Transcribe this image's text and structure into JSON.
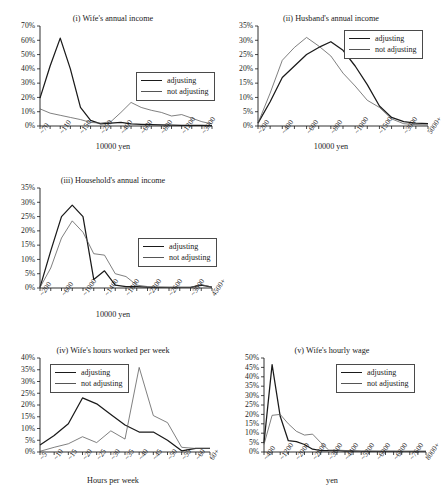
{
  "figure": {
    "legend": {
      "adjusting": "adjusting",
      "not_adjusting": "not adjusting"
    }
  },
  "chart_data": [
    {
      "id": "wife-annual-income",
      "type": "line",
      "title": "(i) Wife's annual income",
      "xlabel": "10000 yen",
      "ylabel": "",
      "ylim": [
        0,
        70
      ],
      "ytick_labels": [
        "0%",
        "10%",
        "20%",
        "30%",
        "40%",
        "50%",
        "60%",
        "70%"
      ],
      "ytick_values": [
        0,
        10,
        20,
        30,
        40,
        50,
        60,
        70
      ],
      "grid": false,
      "legend_position": "center-right",
      "categories": [
        "~70",
        "~90",
        "~110",
        "~130",
        "~150",
        "~200",
        "~250",
        "~300",
        "~400",
        "~500",
        "~600",
        "~700",
        "~800",
        "~900",
        "~1200",
        "~1500",
        "~3000",
        "5000+"
      ],
      "tick_label_every": 2,
      "visible_tick_labels": [
        "~70",
        "~130",
        "~150",
        "~300",
        "~500",
        "~700",
        "~900",
        "~1500",
        "5000+"
      ],
      "series": [
        {
          "name": "adjusting",
          "values": [
            19.5,
            42.0,
            61.5,
            40.0,
            13.0,
            4.0,
            1.5,
            2.0,
            2.5,
            1.5,
            1.2,
            1.0,
            0.8,
            0.6,
            0.5,
            0.5,
            0.4,
            0.3
          ]
        },
        {
          "name": "not adjusting",
          "values": [
            12.0,
            9.0,
            7.5,
            6.0,
            4.5,
            2.5,
            2.0,
            3.0,
            9.5,
            16.5,
            13.0,
            11.0,
            9.5,
            7.0,
            8.0,
            5.5,
            3.0,
            1.5
          ]
        }
      ]
    },
    {
      "id": "husband-annual-income",
      "type": "line",
      "title": "(ii) Husband's annual income",
      "xlabel": "10000 yen",
      "ylabel": "",
      "ylim": [
        0,
        35
      ],
      "ytick_labels": [
        "0%",
        "5%",
        "10%",
        "15%",
        "20%",
        "25%",
        "30%",
        "35%"
      ],
      "ytick_values": [
        0,
        5,
        10,
        15,
        20,
        25,
        30,
        35
      ],
      "grid": false,
      "legend_position": "top-right",
      "categories": [
        "~200",
        "~300",
        "~400",
        "~500",
        "~600",
        "~700",
        "~800",
        "~900",
        "~1000",
        "~1200",
        "~1500",
        "~2000",
        "~3000",
        "~4000",
        "5000+"
      ],
      "tick_label_every": 2,
      "visible_tick_labels": [
        "~200",
        "~400",
        "~600",
        "~800",
        "~1000",
        "~1500",
        "~3000",
        "5000+"
      ],
      "series": [
        {
          "name": "adjusting",
          "values": [
            1.0,
            8.5,
            17.0,
            21.0,
            25.0,
            27.5,
            29.5,
            26.5,
            21.0,
            14.5,
            7.0,
            3.0,
            1.5,
            1.0,
            0.8
          ]
        },
        {
          "name": "not adjusting",
          "values": [
            1.0,
            11.5,
            23.0,
            27.5,
            31.0,
            28.0,
            24.5,
            18.5,
            14.0,
            9.0,
            6.5,
            2.5,
            0.8,
            0.5,
            0.4
          ]
        }
      ]
    },
    {
      "id": "household-annual-income",
      "type": "line",
      "title": "(iii) Household's annual income",
      "xlabel": "10000  yen",
      "ylabel": "",
      "ylim": [
        0,
        35
      ],
      "ytick_labels": [
        "0%",
        "5%",
        "10%",
        "15%",
        "20%",
        "25%",
        "30%",
        "35%"
      ],
      "ytick_values": [
        0,
        5,
        10,
        15,
        20,
        25,
        30,
        35
      ],
      "grid": false,
      "legend_position": "center-right",
      "categories": [
        "~200",
        "~400",
        "~600",
        "~800",
        "~1000",
        "~1200",
        "~1400",
        "~1600",
        "~1800",
        "~2000",
        "~2200",
        "~2400",
        "~2600",
        "~2800",
        "~3000",
        "~3500",
        "4500+"
      ],
      "tick_label_every": 2,
      "visible_tick_labels": [
        "~200",
        "~600",
        "~1000",
        "~1400",
        "~1800",
        "~2200",
        "~2600",
        "~3000",
        "4500+"
      ],
      "series": [
        {
          "name": "adjusting",
          "values": [
            0.2,
            13.0,
            25.0,
            29.0,
            25.0,
            3.0,
            6.0,
            1.0,
            0.5,
            0.5,
            0.3,
            0.2,
            0.2,
            0.2,
            0.2,
            1.0,
            0.3
          ]
        },
        {
          "name": "not adjusting",
          "values": [
            0.2,
            7.0,
            17.5,
            23.5,
            19.5,
            12.0,
            11.5,
            5.0,
            4.0,
            1.0,
            0.5,
            0.3,
            0.2,
            0.2,
            0.2,
            1.2,
            0.3
          ]
        }
      ]
    },
    {
      "id": "wife-hours-worked",
      "type": "line",
      "title": "(iv) Wife's hours worked per week",
      "xlabel": "Hours per week",
      "ylabel": "",
      "ylim": [
        0,
        40
      ],
      "ytick_labels": [
        "0%",
        "5%",
        "10%",
        "15%",
        "20%",
        "25%",
        "30%",
        "35%",
        "40%"
      ],
      "ytick_values": [
        0,
        5,
        10,
        15,
        20,
        25,
        30,
        35,
        40
      ],
      "grid": false,
      "legend_position": "top-left",
      "categories": [
        "~5",
        "~10",
        "~15",
        "~20",
        "~25",
        "~30",
        "~35",
        "~40",
        "~45",
        "~50",
        "~55",
        "~60",
        "60+"
      ],
      "tick_label_every": 1,
      "visible_tick_labels": [
        "~5",
        "~10",
        "~15",
        "~20",
        "~25",
        "~30",
        "~35",
        "~40",
        "~45",
        "~50",
        "~55",
        "~60",
        "60+"
      ],
      "series": [
        {
          "name": "adjusting",
          "values": [
            3.0,
            7.0,
            12.0,
            23.0,
            20.5,
            16.0,
            11.5,
            8.5,
            8.5,
            5.0,
            0.5,
            1.5,
            1.5
          ]
        },
        {
          "name": "not adjusting",
          "values": [
            0.3,
            2.0,
            3.5,
            6.5,
            4.0,
            9.0,
            5.5,
            36.0,
            15.5,
            12.5,
            2.0,
            1.5,
            1.5
          ]
        }
      ]
    },
    {
      "id": "wife-hourly-wage",
      "type": "line",
      "title": "(v) Wife's hourly wage",
      "xlabel": "yen",
      "ylabel": "",
      "ylim": [
        0,
        50
      ],
      "ytick_labels": [
        "0%",
        "5%",
        "10%",
        "15%",
        "20%",
        "25%",
        "30%",
        "35%",
        "40%",
        "45%",
        "50%"
      ],
      "ytick_values": [
        0,
        5,
        10,
        15,
        20,
        25,
        30,
        35,
        40,
        45,
        50
      ],
      "grid": false,
      "legend_position": "top-right",
      "categories": [
        "~400",
        "~800",
        "~1200",
        "~1600",
        "~2000",
        "~2400",
        "~2800",
        "~3200",
        "~3600",
        "~4000",
        "~4400",
        "~4800",
        "~5200",
        "~5600",
        "~6000",
        "~6400",
        "~6800",
        "~7200",
        "~7600",
        "~8000",
        "8000+"
      ],
      "tick_label_every": 2,
      "visible_tick_labels": [
        "~400",
        "~1200",
        "~2000",
        "~2800",
        "~3600",
        "~4400",
        "~5200",
        "~6000",
        "~6800",
        "~7600",
        "8000+"
      ],
      "series": [
        {
          "name": "adjusting",
          "values": [
            5.0,
            46.5,
            19.0,
            6.0,
            5.5,
            4.0,
            1.5,
            0.8,
            0.8,
            0.8,
            0.5,
            0.5,
            0.4,
            0.4,
            0.4,
            0.3,
            0.3,
            0.3,
            0.3,
            0.3,
            0.3
          ]
        },
        {
          "name": "not adjusting",
          "values": [
            4.0,
            19.5,
            20.0,
            15.0,
            11.0,
            9.0,
            9.5,
            5.0,
            1.0,
            1.0,
            0.8,
            0.6,
            0.5,
            0.5,
            0.4,
            0.4,
            0.4,
            0.3,
            0.3,
            0.3,
            0.3
          ]
        }
      ]
    }
  ]
}
